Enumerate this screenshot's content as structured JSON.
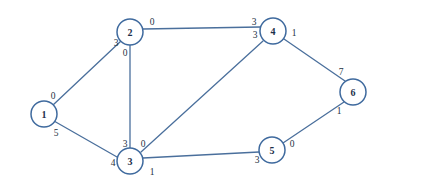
{
  "diagram": {
    "colors": {
      "edge_stroke": "#4a6f9c",
      "node_stroke": "#3f6a9e",
      "node_fill": "#ffffff",
      "label_text": "#24313f",
      "background": "#ffffff"
    },
    "nodes": [
      {
        "id": "1",
        "label": "1",
        "cx": 44,
        "cy": 114,
        "r": 13
      },
      {
        "id": "2",
        "label": "2",
        "cx": 130,
        "cy": 32,
        "r": 13
      },
      {
        "id": "3",
        "label": "3",
        "cx": 130,
        "cy": 161,
        "r": 13
      },
      {
        "id": "4",
        "label": "4",
        "cx": 273,
        "cy": 31,
        "r": 13
      },
      {
        "id": "5",
        "label": "5",
        "cx": 272,
        "cy": 150,
        "r": 13
      },
      {
        "id": "6",
        "label": "6",
        "cx": 353,
        "cy": 92,
        "r": 13
      }
    ],
    "edges": [
      {
        "id": "e-1-2",
        "from": "1",
        "to": "2",
        "x1": 53,
        "y1": 105,
        "x2": 121,
        "y2": 41
      },
      {
        "id": "e-1-3",
        "from": "1",
        "to": "3",
        "x1": 54,
        "y1": 121,
        "x2": 117,
        "y2": 157
      },
      {
        "id": "e-2-4",
        "from": "2",
        "to": "4",
        "x1": 143,
        "y1": 29,
        "x2": 260,
        "y2": 27
      },
      {
        "id": "e-2-3",
        "from": "2",
        "to": "3",
        "x1": 130,
        "y1": 45,
        "x2": 130,
        "y2": 148
      },
      {
        "id": "e-3-4",
        "from": "3",
        "to": "4",
        "x1": 141,
        "y1": 152,
        "x2": 263,
        "y2": 41
      },
      {
        "id": "e-3-5",
        "from": "3",
        "to": "5",
        "x1": 143,
        "y1": 158,
        "x2": 259,
        "y2": 152
      },
      {
        "id": "e-4-6",
        "from": "4",
        "to": "6",
        "x1": 284,
        "y1": 39,
        "x2": 345,
        "y2": 81
      },
      {
        "id": "e-5-6",
        "from": "5",
        "to": "6",
        "x1": 283,
        "y1": 143,
        "x2": 344,
        "y2": 102
      }
    ],
    "edge_labels": [
      {
        "id": "lbl-1-2-at-1",
        "edge": "e-1-2",
        "near_node": "1",
        "text": "0",
        "x": 53,
        "y": 96
      },
      {
        "id": "lbl-1-2-at-2",
        "edge": "e-1-2",
        "near_node": "2",
        "text": "3",
        "x": 116,
        "y": 43
      },
      {
        "id": "lbl-1-3-at-1",
        "edge": "e-1-3",
        "near_node": "1",
        "text": "5",
        "x": 56,
        "y": 133
      },
      {
        "id": "lbl-1-3-at-3",
        "edge": "e-1-3",
        "near_node": "3",
        "text": "4",
        "x": 113,
        "y": 163
      },
      {
        "id": "lbl-2-4-at-2",
        "edge": "e-2-4",
        "near_node": "2",
        "text": "0",
        "x": 152,
        "y": 22
      },
      {
        "id": "lbl-2-4-at-4",
        "edge": "e-2-4",
        "near_node": "4",
        "text": "3",
        "x": 254,
        "y": 22
      },
      {
        "id": "lbl-2-3-at-2",
        "edge": "e-2-3",
        "near_node": "2",
        "text": "0",
        "x": 125,
        "y": 53
      },
      {
        "id": "lbl-2-3-at-3",
        "edge": "e-2-3",
        "near_node": "3",
        "text": "3",
        "x": 125,
        "y": 144
      },
      {
        "id": "lbl-3-4-at-3",
        "edge": "e-3-4",
        "near_node": "3",
        "text": "0",
        "x": 143,
        "y": 144
      },
      {
        "id": "lbl-3-4-at-4",
        "edge": "e-3-4",
        "near_node": "4",
        "text": "3",
        "x": 255,
        "y": 35
      },
      {
        "id": "lbl-3-5-at-3",
        "edge": "e-3-5",
        "near_node": "3",
        "text": "1",
        "x": 152,
        "y": 172
      },
      {
        "id": "lbl-3-5-at-5",
        "edge": "e-3-5",
        "near_node": "5",
        "text": "3",
        "x": 257,
        "y": 160
      },
      {
        "id": "lbl-4-6-at-4",
        "edge": "e-4-6",
        "near_node": "4",
        "text": "1",
        "x": 294,
        "y": 33
      },
      {
        "id": "lbl-4-6-at-6",
        "edge": "e-4-6",
        "near_node": "6",
        "text": "7",
        "x": 341,
        "y": 72
      },
      {
        "id": "lbl-5-6-at-5",
        "edge": "e-5-6",
        "near_node": "5",
        "text": "0",
        "x": 292,
        "y": 144
      },
      {
        "id": "lbl-5-6-at-6",
        "edge": "e-5-6",
        "near_node": "6",
        "text": "1",
        "x": 339,
        "y": 111
      }
    ]
  }
}
